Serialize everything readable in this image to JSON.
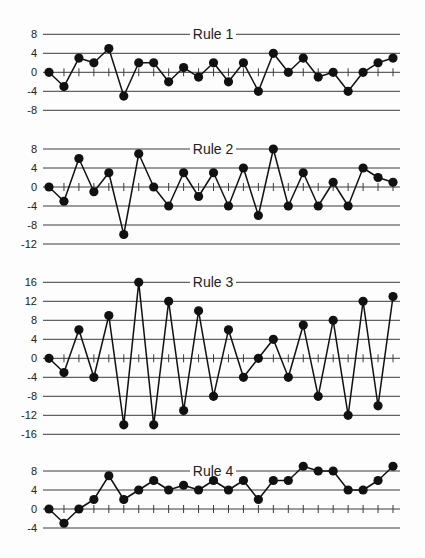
{
  "chart_data": [
    {
      "type": "line",
      "title": "Rule 1",
      "xlabel": "",
      "ylabel": "",
      "yticks": [
        8,
        4,
        0,
        -4,
        -8
      ],
      "ytick_labels": [
        "8",
        "4",
        "0",
        "-4",
        "-8"
      ],
      "ylim": [
        -8,
        8
      ],
      "grid": true,
      "markers": "filled-circle",
      "x": [
        1,
        2,
        3,
        4,
        5,
        6,
        7,
        8,
        9,
        10,
        11,
        12,
        13,
        14,
        15,
        16,
        17,
        18,
        19,
        20,
        21,
        22,
        23,
        24
      ],
      "values": [
        0,
        -3,
        3,
        2,
        5,
        -5,
        2,
        2,
        -2,
        1,
        -1,
        2,
        -2,
        2,
        -4,
        4,
        0,
        3,
        -1,
        0,
        -4,
        0,
        2,
        3
      ]
    },
    {
      "type": "line",
      "title": "Rule 2",
      "xlabel": "",
      "ylabel": "",
      "yticks": [
        8,
        4,
        0,
        -4,
        -8,
        -12
      ],
      "ytick_labels": [
        "8",
        "4",
        "0",
        "-4",
        "-8",
        "-12"
      ],
      "ylim": [
        -12,
        8
      ],
      "grid": true,
      "markers": "filled-circle",
      "x": [
        1,
        2,
        3,
        4,
        5,
        6,
        7,
        8,
        9,
        10,
        11,
        12,
        13,
        14,
        15,
        16,
        17,
        18,
        19,
        20,
        21,
        22,
        23,
        24
      ],
      "values": [
        0,
        -3,
        6,
        -1,
        3,
        -10,
        7,
        0,
        -4,
        3,
        -2,
        3,
        -4,
        4,
        -6,
        8,
        -4,
        3,
        -4,
        1,
        -4,
        4,
        2,
        1
      ]
    },
    {
      "type": "line",
      "title": "Rule 3",
      "xlabel": "",
      "ylabel": "",
      "yticks": [
        16,
        12,
        8,
        4,
        0,
        -4,
        -8,
        -12,
        -16
      ],
      "ytick_labels": [
        "16",
        "12",
        "8",
        "4",
        "0",
        "-4",
        "-8",
        "-12",
        "-16"
      ],
      "ylim": [
        -16,
        16
      ],
      "grid": true,
      "markers": "filled-circle",
      "x": [
        1,
        2,
        3,
        4,
        5,
        6,
        7,
        8,
        9,
        10,
        11,
        12,
        13,
        14,
        15,
        16,
        17,
        18,
        19,
        20,
        21,
        22,
        23,
        24
      ],
      "values": [
        0,
        -3,
        6,
        -4,
        9,
        -14,
        16,
        -14,
        12,
        -11,
        10,
        -8,
        6,
        -4,
        0,
        4,
        -4,
        7,
        -8,
        8,
        -12,
        12,
        -10,
        13
      ]
    },
    {
      "type": "line",
      "title": "Rule 4",
      "xlabel": "",
      "ylabel": "",
      "yticks": [
        8,
        4,
        0,
        -4
      ],
      "ytick_labels": [
        "8",
        "4",
        "0",
        "-4"
      ],
      "ylim": [
        -4,
        8
      ],
      "grid": true,
      "markers": "filled-circle",
      "x": [
        1,
        2,
        3,
        4,
        5,
        6,
        7,
        8,
        9,
        10,
        11,
        12,
        13,
        14,
        15,
        16,
        17,
        18,
        19,
        20,
        21,
        22,
        23,
        24
      ],
      "values": [
        0,
        -3,
        0,
        2,
        7,
        2,
        4,
        6,
        4,
        5,
        4,
        6,
        4,
        6,
        2,
        6,
        6,
        9,
        8,
        8,
        4,
        4,
        6,
        9
      ]
    }
  ]
}
